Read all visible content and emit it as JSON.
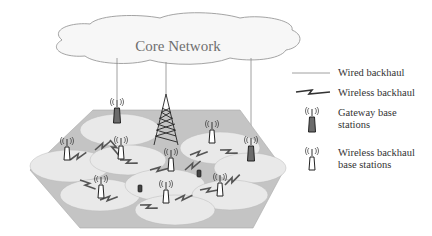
{
  "title": "Core Network",
  "legend": {
    "wired": "Wired backhaul",
    "wireless": "Wireless backhaul",
    "gateway": "Gateway base stations",
    "gateway_l1": "Gateway base",
    "gateway_l2": "stations",
    "wbs_l1": "Wireless backhaul",
    "wbs_l2": "base stations"
  },
  "colors": {
    "ground": "#c4c4c4",
    "cell": "#e9e9e9",
    "gateway": "#6b6b6b",
    "wireless_bs": "#ffffff",
    "link": "#555555",
    "cloud_stroke": "#9a9a9a"
  },
  "elements": {
    "gateway_base_stations": 2,
    "wireless_backhaul_base_stations": 8,
    "macro_tower": 1,
    "user_devices": 2
  }
}
